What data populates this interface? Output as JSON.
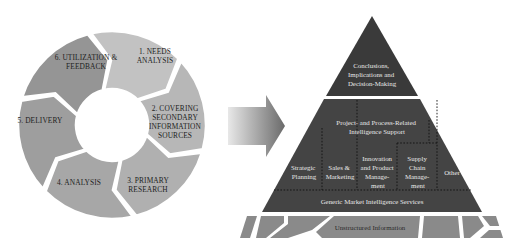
{
  "diagram": {
    "cycle": {
      "steps": [
        {
          "id": 1,
          "lines": [
            "1. NEEDS",
            "ANALYSIS"
          ],
          "color": "#c2c2c2"
        },
        {
          "id": 2,
          "lines": [
            "2. COVERING",
            "SECONDARY",
            "INFORMATION",
            "SOURCES"
          ],
          "color": "#b7b7b7"
        },
        {
          "id": 3,
          "lines": [
            "3. PRIMARY",
            "RESEARCH"
          ],
          "color": "#b0b0b0"
        },
        {
          "id": 4,
          "lines": [
            "4. ANALYSIS"
          ],
          "color": "#a7a7a7"
        },
        {
          "id": 5,
          "lines": [
            "5. DELIVERY"
          ],
          "color": "#9e9e9e"
        },
        {
          "id": 6,
          "lines": [
            "6. UTILIZATION &",
            "FEEDBACK"
          ],
          "color": "#959595"
        }
      ]
    },
    "arrow": {
      "gradient_start": "#e8e8e8",
      "gradient_end": "#6a6a6a"
    },
    "pyramid": {
      "top": {
        "lines": [
          "Conclusions,",
          "Implications and",
          "Decision-Making"
        ],
        "color": "#3a3a3a"
      },
      "middle": {
        "header_lines": [
          "Project- and Process-Related",
          "Intelligence Support"
        ],
        "color": "#444444",
        "columns": [
          {
            "lines": [
              "Strategic",
              "Planning"
            ]
          },
          {
            "lines": [
              "Sales &",
              "Marketing"
            ]
          },
          {
            "lines": [
              "Innovation",
              "and Product",
              "Manage-",
              "ment"
            ]
          },
          {
            "lines": [
              "Supply",
              "Chain",
              "Manage-",
              "ment"
            ]
          },
          {
            "lines": [
              "Other"
            ]
          }
        ]
      },
      "base_band": {
        "label": "Generic Market Intelligence Services",
        "color": "#444444"
      },
      "foundation": {
        "label": "Unstructured Information",
        "color": "#8a8a8a"
      }
    }
  }
}
